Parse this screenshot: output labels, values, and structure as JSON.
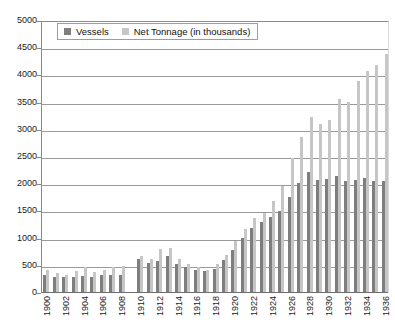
{
  "chart_data": {
    "type": "bar",
    "title": "",
    "xlabel": "",
    "ylabel": "",
    "ylim": [
      0,
      5000
    ],
    "ytick_step": 500,
    "grid": true,
    "legend_position": "top-left inside plot",
    "yticks": [
      "5000",
      "4500",
      "4000",
      "3500",
      "3000",
      "2500",
      "2000",
      "1500",
      "1000",
      "500",
      "0"
    ],
    "x": [
      1900,
      1901,
      1902,
      1903,
      1904,
      1905,
      1906,
      1907,
      1908,
      1909,
      1910,
      1911,
      1912,
      1913,
      1914,
      1915,
      1916,
      1917,
      1918,
      1919,
      1920,
      1921,
      1922,
      1923,
      1924,
      1925,
      1926,
      1927,
      1928,
      1929,
      1930,
      1931,
      1932,
      1933,
      1934,
      1935,
      1936
    ],
    "xtick_labels": [
      "1900",
      "1902",
      "1904",
      "1906",
      "1908",
      "1910",
      "1912",
      "1914",
      "1916",
      "1918",
      "1920",
      "1922",
      "1924",
      "1926",
      "1928",
      "1930",
      "1932",
      "1934",
      "1936"
    ],
    "xtick_label_rotation": -90,
    "missing_years": [
      1909
    ],
    "series": [
      {
        "name": "Vessels",
        "color": "#7e7e7e",
        "values": [
          330,
          300,
          290,
          300,
          310,
          300,
          330,
          330,
          330,
          null,
          620,
          560,
          580,
          680,
          540,
          480,
          420,
          400,
          450,
          600,
          790,
          1020,
          1200,
          1300,
          1390,
          1500,
          1770,
          2020,
          2230,
          2080,
          2100,
          2160,
          2050,
          2080,
          2110,
          2050,
          2050
        ]
      },
      {
        "name": "Net Tonnage (in thousands)",
        "color": "#c6c6c6",
        "values": [
          420,
          360,
          340,
          400,
          470,
          390,
          430,
          480,
          500,
          null,
          680,
          620,
          800,
          820,
          620,
          530,
          470,
          430,
          540,
          700,
          960,
          1180,
          1380,
          1480,
          1700,
          1960,
          2480,
          2870,
          3230,
          3100,
          3180,
          3560,
          3520,
          3900,
          4080,
          4190,
          4400
        ]
      }
    ]
  },
  "legend": {
    "items": [
      {
        "label": "Vessels",
        "swatch": "#7e7e7e"
      },
      {
        "label": "Net Tonnage (in thousands)",
        "swatch": "#c6c6c6"
      }
    ]
  }
}
